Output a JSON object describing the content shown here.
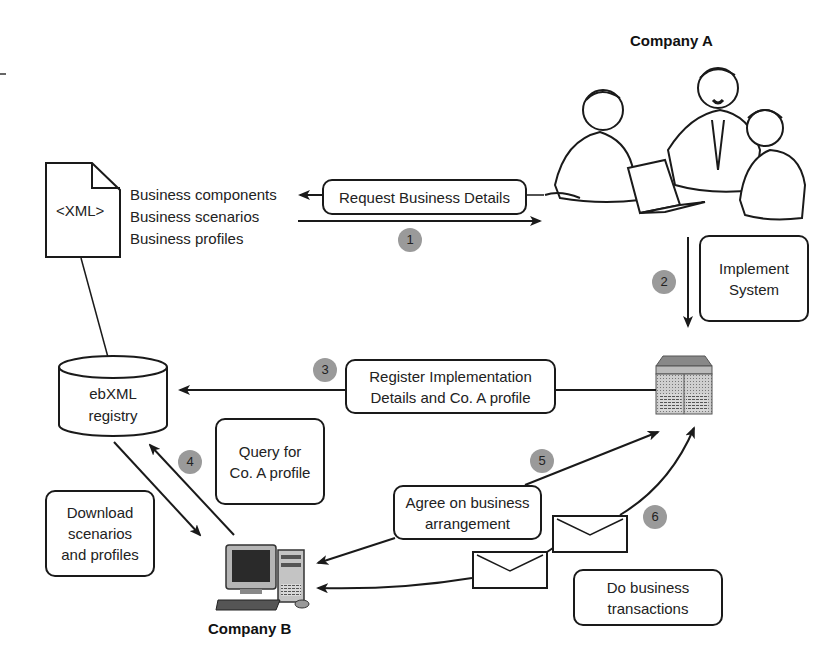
{
  "diagram": {
    "company_a": {
      "label": "Company A"
    },
    "company_b": {
      "label": "Company B"
    },
    "xml_document": {
      "label": "<XML>"
    },
    "xml_contents": [
      "Business components",
      "Business scenarios",
      "Business profiles"
    ],
    "registry": {
      "line1": "ebXML",
      "line2": "registry"
    },
    "steps": [
      {
        "number": "1",
        "label_line1": "Request Business Details",
        "label_line2": ""
      },
      {
        "number": "2",
        "label_line1": "Implement",
        "label_line2": "System"
      },
      {
        "number": "3",
        "label_line1": "Register Implementation",
        "label_line2": "Details and Co. A profile"
      },
      {
        "number": "4",
        "label_line1": "Query for",
        "label_line2": "Co. A profile"
      },
      {
        "number": "5",
        "label_line1": "Agree on business",
        "label_line2": "arrangement"
      },
      {
        "number": "6",
        "label_line1": "Do business",
        "label_line2": "transactions"
      }
    ],
    "download_box": {
      "line1": "Download",
      "line2": "scenarios",
      "line3": "and profiles"
    },
    "colors": {
      "line": "#1a1a1a",
      "badge": "#9a9a9a",
      "background": "#ffffff"
    }
  }
}
